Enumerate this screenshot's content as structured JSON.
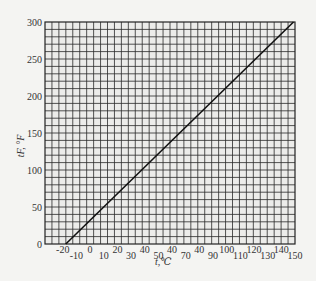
{
  "chart_data": {
    "type": "line",
    "title": "",
    "xlabel": "t,℃",
    "ylabel": "tF, °F",
    "xlim": [
      -33,
      150
    ],
    "ylim": [
      0,
      300
    ],
    "grid": true,
    "legend": null,
    "x_ticks_upper": [
      "-20",
      "0",
      "20",
      "40",
      "40",
      "40",
      "100",
      "120",
      "140"
    ],
    "x_ticks_upper_values": [
      -20,
      0,
      20,
      40,
      60,
      80,
      100,
      120,
      140
    ],
    "x_ticks_lower": [
      "-10",
      "10",
      "30",
      "50",
      "70",
      "90",
      "110",
      "130",
      "150"
    ],
    "x_ticks_lower_values": [
      -10,
      10,
      30,
      50,
      70,
      90,
      110,
      130,
      150
    ],
    "y_ticks": [
      "0",
      "50",
      "100",
      "150",
      "200",
      "250",
      "300"
    ],
    "y_tick_values": [
      0,
      50,
      100,
      150,
      200,
      250,
      300
    ],
    "series": [
      {
        "name": "°F = 1.8·℃ + 32",
        "x": [
          -17.8,
          0,
          50,
          100,
          148.9
        ],
        "values": [
          0,
          32,
          122,
          212,
          300
        ]
      }
    ]
  },
  "colors": {
    "background": "#f4f4f2",
    "grid": "#2a2a2a",
    "line": "#111111",
    "text": "#333333"
  }
}
